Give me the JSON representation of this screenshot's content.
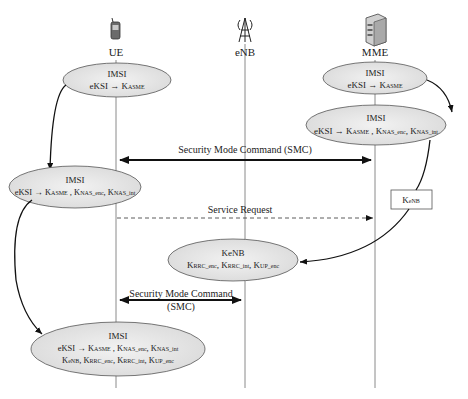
{
  "diagram": {
    "type": "sequence-diagram",
    "entities": [
      {
        "id": "ue",
        "label": "UE",
        "icon": "mobile-phone-icon"
      },
      {
        "id": "enb",
        "label": "eNB",
        "icon": "antenna-tower-icon"
      },
      {
        "id": "mme",
        "label": "MME",
        "icon": "server-icon"
      }
    ],
    "states": {
      "ue_1": {
        "line1": "IMSI",
        "line2": "eKSI → K",
        "line2_sub": "ASME"
      },
      "mme_1": {
        "line1": "IMSI",
        "line2": "eKSI → K",
        "line2_sub": "ASME"
      },
      "mme_2": {
        "line1": "IMSI",
        "line2_parts": [
          "eKSI → K",
          "ASME",
          " , K",
          "NAS_enc",
          ", K",
          "NAS_int"
        ]
      },
      "ue_2": {
        "line1": "IMSI",
        "line2_parts": [
          "eKSI → K",
          "ASME",
          " , K",
          "NAS_enc",
          ", K",
          "NAS_int"
        ]
      },
      "kenb_box": {
        "label": "K",
        "sub": "eNB"
      },
      "enb_1": {
        "line1": "KeNB",
        "line2_parts": [
          "K",
          "RRC_enc",
          ", K",
          "RRC_int",
          ", K",
          "UP_enc"
        ]
      },
      "ue_3": {
        "line1": "IMSI",
        "line2_parts": [
          "eKSI → K",
          "ASME",
          " , K",
          "NAS_enc",
          ", K",
          "NAS_int"
        ],
        "line3_parts": [
          "K",
          "eNB",
          ", K",
          "RRC_enc",
          ", K",
          "RRC_int",
          ", K",
          "UP_enc"
        ]
      }
    },
    "messages": [
      {
        "id": "smc1",
        "label": "Security Mode Command (SMC)",
        "from": "mme",
        "to": "ue",
        "style": "bidirectional-bold"
      },
      {
        "id": "service_request",
        "label": "Service Request",
        "from": "ue",
        "to": "mme",
        "style": "dashed"
      },
      {
        "id": "smc2",
        "label_line1": "Security Mode Command",
        "label_line2": "(SMC)",
        "from": "enb",
        "to": "ue",
        "style": "bidirectional-bold"
      }
    ]
  }
}
